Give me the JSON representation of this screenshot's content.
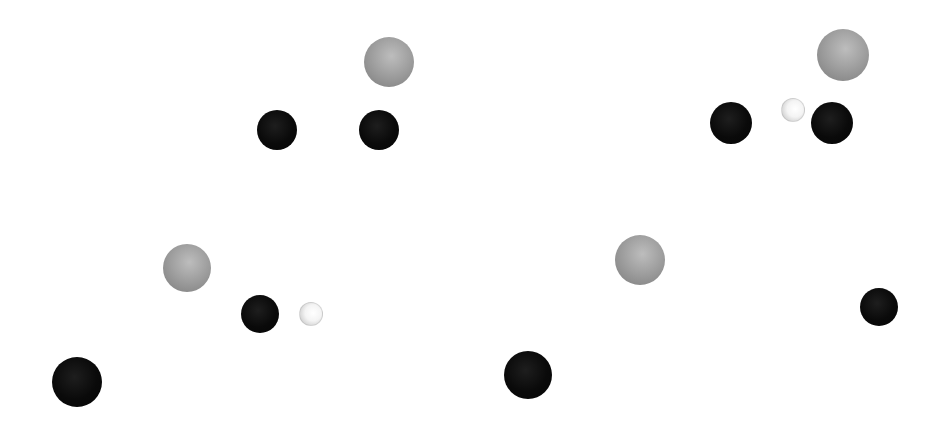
{
  "figure": {
    "background": "#ffffff",
    "width": 939,
    "height": 426,
    "atom_types": {
      "dark": {
        "color": "#0a0a0a",
        "description": "dark sphere"
      },
      "gray": {
        "color": "#a0a0a0",
        "description": "gray sphere"
      },
      "light": {
        "color": "#f2f2f2",
        "description": "small white sphere"
      }
    },
    "fragments": [
      {
        "name": "fragment-top-left",
        "atoms": [
          {
            "type": "gray",
            "cx": 389,
            "cy": 62,
            "r": 25
          },
          {
            "type": "dark",
            "cx": 277,
            "cy": 130,
            "r": 20
          },
          {
            "type": "dark",
            "cx": 379,
            "cy": 130,
            "r": 20
          }
        ]
      },
      {
        "name": "fragment-top-right",
        "atoms": [
          {
            "type": "gray",
            "cx": 843,
            "cy": 55,
            "r": 26
          },
          {
            "type": "dark",
            "cx": 731,
            "cy": 123,
            "r": 21
          },
          {
            "type": "light",
            "cx": 793,
            "cy": 110,
            "r": 12
          },
          {
            "type": "dark",
            "cx": 832,
            "cy": 123,
            "r": 21
          }
        ]
      },
      {
        "name": "fragment-bottom-left",
        "atoms": [
          {
            "type": "gray",
            "cx": 187,
            "cy": 268,
            "r": 24
          },
          {
            "type": "dark",
            "cx": 260,
            "cy": 314,
            "r": 19
          },
          {
            "type": "light",
            "cx": 311,
            "cy": 314,
            "r": 12
          },
          {
            "type": "dark",
            "cx": 77,
            "cy": 382,
            "r": 25
          }
        ]
      },
      {
        "name": "fragment-bottom-right",
        "atoms": [
          {
            "type": "gray",
            "cx": 640,
            "cy": 260,
            "r": 25
          },
          {
            "type": "dark",
            "cx": 528,
            "cy": 375,
            "r": 24
          },
          {
            "type": "dark",
            "cx": 879,
            "cy": 307,
            "r": 19
          }
        ]
      }
    ]
  }
}
